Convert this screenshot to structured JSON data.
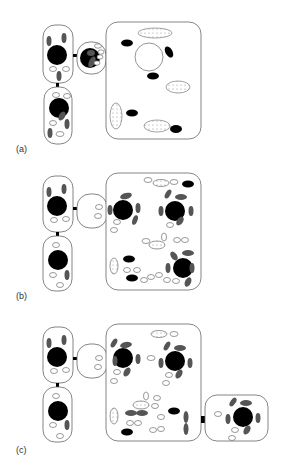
{
  "figure": {
    "panels": [
      {
        "id": "a",
        "label": "(a)"
      },
      {
        "id": "b",
        "label": "(b)"
      },
      {
        "id": "c",
        "label": "(c)"
      }
    ]
  },
  "colors": {
    "outline": "#666666",
    "nucleus": "#000000",
    "chloroplast": "#555555",
    "background": "#ffffff"
  }
}
